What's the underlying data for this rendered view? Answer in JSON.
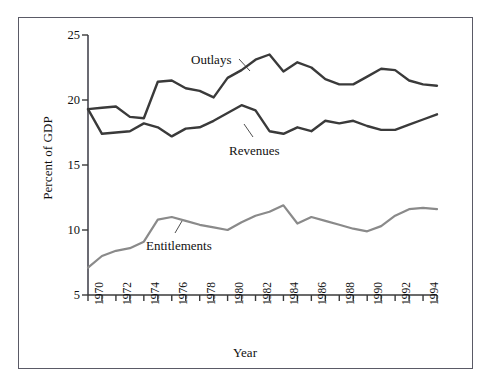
{
  "chart_data": {
    "type": "line",
    "title": "",
    "xlabel": "Year",
    "ylabel": "Percent of GDP",
    "xlim": [
      1970,
      1995
    ],
    "ylim": [
      5,
      25
    ],
    "yticks": [
      5,
      10,
      15,
      20,
      25
    ],
    "xticks": [
      1970,
      1971,
      1972,
      1973,
      1974,
      1975,
      1976,
      1977,
      1978,
      1979,
      1980,
      1981,
      1982,
      1983,
      1984,
      1985,
      1986,
      1987,
      1988,
      1989,
      1990,
      1991,
      1992,
      1993,
      1994,
      1995
    ],
    "xtick_labels": [
      "1970",
      "",
      "1972",
      "",
      "1974",
      "",
      "1976",
      "",
      "1978",
      "",
      "1980",
      "",
      "1982",
      "",
      "1984",
      "",
      "1986",
      "",
      "1988",
      "",
      "1990",
      "",
      "1992",
      "",
      "1994",
      ""
    ],
    "grid": false,
    "legend_position": "inline-annotations",
    "x": [
      1970,
      1971,
      1972,
      1973,
      1974,
      1975,
      1976,
      1977,
      1978,
      1979,
      1980,
      1981,
      1982,
      1983,
      1984,
      1985,
      1986,
      1987,
      1988,
      1989,
      1990,
      1991,
      1992,
      1993,
      1994,
      1995
    ],
    "series": [
      {
        "name": "Outlays",
        "color": "#3a3a3a",
        "label_x": 1978.4,
        "label_y": 23.6,
        "values": [
          19.3,
          19.4,
          19.5,
          18.7,
          18.6,
          21.4,
          21.5,
          20.9,
          20.7,
          20.2,
          21.7,
          22.3,
          23.1,
          23.5,
          22.2,
          22.9,
          22.5,
          21.6,
          21.2,
          21.2,
          21.8,
          22.4,
          22.3,
          21.5,
          21.2,
          21.1
        ]
      },
      {
        "name": "Revenues",
        "color": "#3a3a3a",
        "label_x": 1980.6,
        "label_y": 16.6,
        "values": [
          19.3,
          17.4,
          17.5,
          17.6,
          18.2,
          17.9,
          17.2,
          17.8,
          17.9,
          18.4,
          19.0,
          19.6,
          19.2,
          17.6,
          17.4,
          17.9,
          17.6,
          18.4,
          18.2,
          18.4,
          18.0,
          17.7,
          17.7,
          18.1,
          18.5,
          18.9
        ]
      },
      {
        "name": "Entitlements",
        "color": "#8a8a8a",
        "label_x": 1974.9,
        "label_y": 9.4,
        "values": [
          7.1,
          8.0,
          8.4,
          8.6,
          9.1,
          10.8,
          11.0,
          10.7,
          10.4,
          10.2,
          10.0,
          10.6,
          11.1,
          11.4,
          11.9,
          10.5,
          11.0,
          10.7,
          10.4,
          10.1,
          9.9,
          10.3,
          11.1,
          11.6,
          11.7,
          11.6
        ]
      }
    ]
  },
  "figure": {
    "frame_color": "#5a5a66",
    "background": "#ffffff"
  }
}
